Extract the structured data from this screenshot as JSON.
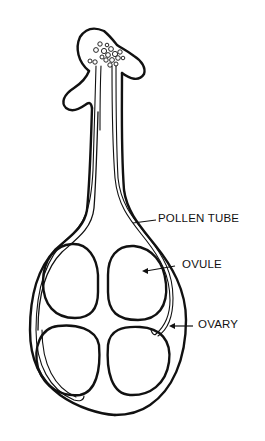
{
  "diagram": {
    "labels": [
      {
        "id": "pollen-tube",
        "text": "POLLEN TUBE"
      },
      {
        "id": "ovule",
        "text": "OVULE"
      },
      {
        "id": "ovary",
        "text": "OVARY"
      }
    ],
    "parts": [
      "stigma",
      "pollen-grains",
      "style",
      "pollen-tubes",
      "ovary",
      "ovules"
    ],
    "ovule_count": 4,
    "colors": {
      "line": "#111111",
      "background": "#ffffff"
    }
  }
}
